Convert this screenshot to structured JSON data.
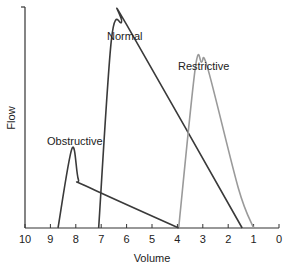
{
  "chart_data": {
    "type": "line",
    "title": "",
    "xlabel": "Volume",
    "ylabel": "Flow",
    "xlim": [
      10,
      0
    ],
    "x_reversed": true,
    "x_ticks": [
      "10",
      "9",
      "8",
      "7",
      "6",
      "5",
      "4",
      "3",
      "2",
      "1",
      "0"
    ],
    "grid": false,
    "legend": "inline curve labels",
    "series": [
      {
        "name": "Normal",
        "color": "#3a3a3a",
        "points": [
          [
            7.1,
            0
          ],
          [
            6.6,
            0.85
          ],
          [
            6.2,
            0.93
          ],
          [
            6.0,
            0.92
          ],
          [
            1.45,
            0
          ]
        ]
      },
      {
        "name": "Restrictive",
        "color": "#9a9a9a",
        "points": [
          [
            3.95,
            0
          ],
          [
            3.3,
            0.72
          ],
          [
            3.05,
            0.75
          ],
          [
            2.8,
            0.72
          ],
          [
            1.6,
            0.18
          ],
          [
            1.0,
            0
          ]
        ]
      },
      {
        "name": "Obstructive",
        "color": "#3a3a3a",
        "points": [
          [
            8.7,
            0
          ],
          [
            8.15,
            0.36
          ],
          [
            7.9,
            0.22
          ],
          [
            7.6,
            0.19
          ],
          [
            3.95,
            0
          ]
        ]
      }
    ]
  },
  "labels": {
    "xlabel": "Volume",
    "ylabel": "Flow",
    "normal": "Normal",
    "restrictive": "Restrictive",
    "obstructive": "Obstructive",
    "ticks": [
      "10",
      "9",
      "8",
      "7",
      "6",
      "5",
      "4",
      "3",
      "2",
      "1",
      "0"
    ]
  }
}
